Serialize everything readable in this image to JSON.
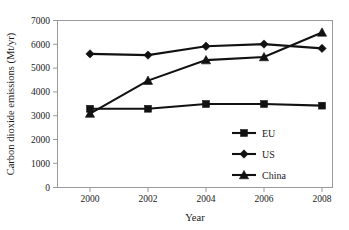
{
  "chart_data": {
    "type": "line",
    "title": "",
    "xlabel": "Year",
    "ylabel": "Carbon dioxide emissions (Mt/yr)",
    "categories": [
      2000,
      2002,
      2004,
      2006,
      2008
    ],
    "x": [
      2000,
      2002,
      2004,
      2006,
      2008
    ],
    "xlim": [
      1999,
      2009
    ],
    "ylim": [
      0,
      7000
    ],
    "ytick_labels": [
      "0",
      "1000",
      "2000",
      "3000",
      "4000",
      "5000",
      "6000",
      "7000"
    ],
    "ytick_values": [
      0,
      1000,
      2000,
      3000,
      4000,
      5000,
      6000,
      7000
    ],
    "xtick_labels": [
      "2000",
      "2002",
      "2004",
      "2006",
      "2008"
    ],
    "grid": false,
    "legend_position": "inside-lower-right",
    "series": [
      {
        "name": "EU",
        "marker": "square",
        "color": "#111111",
        "values": [
          3300,
          3300,
          3500,
          3500,
          3430
        ]
      },
      {
        "name": "US",
        "marker": "diamond",
        "color": "#111111",
        "values": [
          5600,
          5550,
          5920,
          6010,
          5830
        ]
      },
      {
        "name": "China",
        "marker": "triangle",
        "color": "#111111",
        "values": [
          3100,
          4480,
          5340,
          5470,
          6500
        ]
      }
    ]
  },
  "legend": {
    "items": [
      {
        "label": "EU",
        "marker": "square"
      },
      {
        "label": "US",
        "marker": "diamond"
      },
      {
        "label": "China",
        "marker": "triangle"
      }
    ]
  },
  "axes": {
    "y_title": "Carbon dioxide emissions (Mt/yr)",
    "x_title": "Year"
  }
}
